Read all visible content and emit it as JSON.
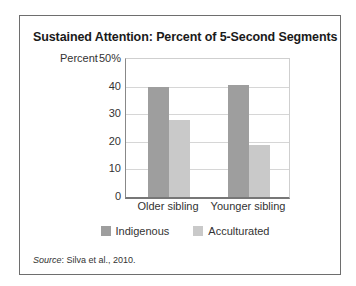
{
  "figure": {
    "title": "Sustained Attention: Percent of 5-Second Segments",
    "source_label": "Source",
    "source_text": ": Silva et al., 2010."
  },
  "chart_data": {
    "type": "bar",
    "title": "Sustained Attention: Percent of 5-Second Segments",
    "xlabel": "",
    "ylabel": "Percent",
    "ylim": [
      0,
      50
    ],
    "yticks": [
      "0",
      "10",
      "20",
      "30",
      "40",
      "50%"
    ],
    "grid": true,
    "legend_position": "bottom",
    "categories": [
      "Older sibling",
      "Younger sibling"
    ],
    "series": [
      {
        "name": "Indigenous",
        "color": "#9e9e9e",
        "values": [
          40,
          40.5
        ]
      },
      {
        "name": "Acculturated",
        "color": "#c9c9c9",
        "values": [
          28,
          19
        ]
      }
    ]
  }
}
